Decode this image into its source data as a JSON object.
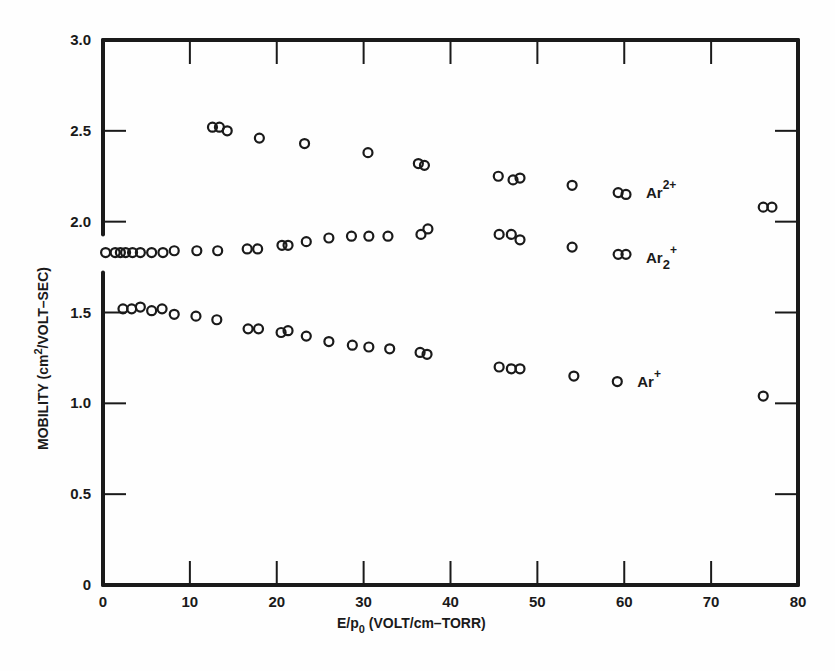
{
  "chart_data": {
    "type": "scatter",
    "title": "",
    "xlabel": "E/p0 (VOLT/cm-TORR)",
    "xlabel_parts": {
      "main": "E/p",
      "sub": "0",
      "rest": " (VOLT/cm–TORR)"
    },
    "ylabel": "MOBILITY (cm2/VOLT-SEC)",
    "ylabel_parts": {
      "main": "MOBILITY (cm",
      "sup": "2",
      "rest": "/VOLT–SEC)"
    },
    "xlim": [
      0,
      80
    ],
    "ylim": [
      0,
      3.0
    ],
    "x_ticks": [
      0,
      10,
      20,
      30,
      40,
      50,
      60,
      70,
      80
    ],
    "x_tick_labels": [
      "0",
      "10",
      "20",
      "30",
      "40",
      "50",
      "60",
      "70",
      "80"
    ],
    "y_ticks": [
      0,
      0.5,
      1.0,
      1.5,
      2.0,
      2.5,
      3.0
    ],
    "y_tick_labels": [
      "0",
      "0.5",
      "1.0",
      "1.5",
      "2.0",
      "2.5",
      "3.0"
    ],
    "grid": false,
    "legend": "inline labels",
    "y_axis_break": [
      1.72,
      1.93
    ],
    "marker": "open-circle",
    "series": [
      {
        "name": "Ar2+ (doubly charged)",
        "label_main": "Ar",
        "label_sup": "2+",
        "label_sub": "",
        "label_pos": [
          62.5,
          2.16
        ],
        "points": [
          [
            12.6,
            2.52
          ],
          [
            13.4,
            2.52
          ],
          [
            14.3,
            2.5
          ],
          [
            18.0,
            2.46
          ],
          [
            23.2,
            2.43
          ],
          [
            30.5,
            2.38
          ],
          [
            36.3,
            2.32
          ],
          [
            37.0,
            2.31
          ],
          [
            45.5,
            2.25
          ],
          [
            47.2,
            2.23
          ],
          [
            48.0,
            2.24
          ],
          [
            54.0,
            2.2
          ],
          [
            59.3,
            2.16
          ],
          [
            60.2,
            2.15
          ],
          [
            76.0,
            2.08
          ],
          [
            77.0,
            2.08
          ]
        ]
      },
      {
        "name": "Ar2+ (dimer ion)",
        "label_main": "Ar",
        "label_sup": "+",
        "label_sub": "2",
        "label_pos": [
          62.5,
          1.8
        ],
        "points": [
          [
            0.3,
            1.83
          ],
          [
            1.4,
            1.83
          ],
          [
            2.0,
            1.83
          ],
          [
            2.6,
            1.83
          ],
          [
            3.4,
            1.83
          ],
          [
            4.3,
            1.83
          ],
          [
            5.6,
            1.83
          ],
          [
            6.9,
            1.83
          ],
          [
            8.2,
            1.84
          ],
          [
            10.8,
            1.84
          ],
          [
            13.2,
            1.84
          ],
          [
            16.6,
            1.85
          ],
          [
            17.8,
            1.85
          ],
          [
            20.6,
            1.87
          ],
          [
            21.3,
            1.87
          ],
          [
            23.4,
            1.89
          ],
          [
            26.0,
            1.91
          ],
          [
            28.6,
            1.92
          ],
          [
            30.6,
            1.92
          ],
          [
            32.8,
            1.92
          ],
          [
            36.6,
            1.93
          ],
          [
            37.4,
            1.96
          ],
          [
            45.6,
            1.93
          ],
          [
            47.0,
            1.93
          ],
          [
            48.0,
            1.9
          ],
          [
            54.0,
            1.86
          ],
          [
            59.3,
            1.82
          ],
          [
            60.2,
            1.82
          ]
        ]
      },
      {
        "name": "Ar+",
        "label_main": "Ar",
        "label_sup": "+",
        "label_sub": "",
        "label_pos": [
          61.5,
          1.12
        ],
        "points": [
          [
            2.3,
            1.52
          ],
          [
            3.3,
            1.52
          ],
          [
            4.3,
            1.53
          ],
          [
            5.6,
            1.51
          ],
          [
            6.8,
            1.52
          ],
          [
            8.2,
            1.49
          ],
          [
            10.7,
            1.48
          ],
          [
            13.1,
            1.46
          ],
          [
            16.7,
            1.41
          ],
          [
            17.9,
            1.41
          ],
          [
            20.5,
            1.39
          ],
          [
            21.3,
            1.4
          ],
          [
            23.4,
            1.37
          ],
          [
            26.0,
            1.34
          ],
          [
            28.7,
            1.32
          ],
          [
            30.6,
            1.31
          ],
          [
            33.0,
            1.3
          ],
          [
            36.5,
            1.28
          ],
          [
            37.3,
            1.27
          ],
          [
            45.6,
            1.2
          ],
          [
            47.0,
            1.19
          ],
          [
            48.0,
            1.19
          ],
          [
            54.2,
            1.15
          ],
          [
            59.2,
            1.12
          ],
          [
            76.0,
            1.04
          ]
        ]
      }
    ]
  },
  "colors": {
    "ink": "#1a1a1a",
    "background": "#fefefe"
  }
}
